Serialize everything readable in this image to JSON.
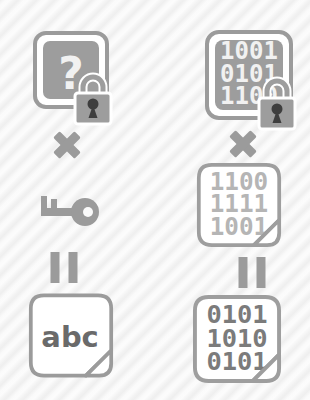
{
  "colors": {
    "background": "#fcfcfc",
    "stripe": "#e9e9e9",
    "primary_gray": "#9b9b9b",
    "fill_gray": "#9d9d9d",
    "cutout_white": "#f1f1f1",
    "keyhole_dark": "#3e3e3e",
    "binary_light": "#b5b5b5",
    "binary_dark": "#7b7b7b",
    "abc_dark": "#6a6a6a"
  },
  "icons": [
    "padlock-icon",
    "key-icon",
    "multiply-icon",
    "equals-icon",
    "page-fold-icon",
    "question-mark"
  ],
  "left_column": {
    "ciphertext_symbol": {
      "text": "?"
    },
    "multiply_operator": "multiply",
    "key": "key-icon",
    "equals_operator": "equals",
    "plaintext": {
      "text": "abc"
    }
  },
  "right_column": {
    "ciphertext_binary": {
      "rows": [
        "1001",
        "0101",
        "1100"
      ]
    },
    "multiply_operator": "multiply",
    "key_binary": {
      "rows": [
        "1100",
        "1111",
        "1001"
      ]
    },
    "equals_operator": "equals",
    "plaintext_binary": {
      "rows": [
        "0101",
        "1010",
        "0101"
      ]
    }
  }
}
